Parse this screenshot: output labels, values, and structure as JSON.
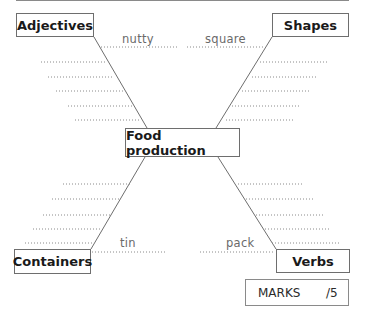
{
  "diagram": {
    "center": {
      "label": "Food production"
    },
    "categories": [
      {
        "id": "adjectives",
        "label": "Adjectives",
        "example": "nutty"
      },
      {
        "id": "shapes",
        "label": "Shapes",
        "example": "square"
      },
      {
        "id": "containers",
        "label": "Containers",
        "example": "tin"
      },
      {
        "id": "verbs",
        "label": "Verbs",
        "example": "pack"
      }
    ],
    "blank_lines_per_category": 5
  },
  "marks": {
    "label": "MARKS",
    "total": "/5"
  },
  "colors": {
    "line": "#6e6e6e",
    "dots": "#8a8a8a",
    "text": "#1a1a1a",
    "example_text": "#6a6a6a"
  }
}
